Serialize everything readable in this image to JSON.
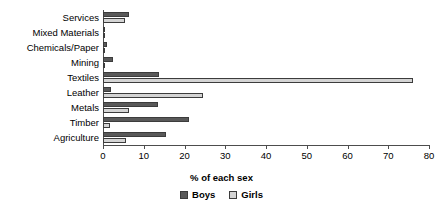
{
  "chart_data": {
    "type": "bar",
    "orientation": "horizontal",
    "title": "",
    "xlabel": "% of each sex",
    "ylabel": "",
    "xlim": [
      0,
      80
    ],
    "xticks": [
      0,
      10,
      20,
      30,
      40,
      50,
      60,
      70,
      80
    ],
    "grid": false,
    "legend_position": "bottom-center",
    "categories": [
      "Services",
      "Mixed Materials",
      "Chemicals/Paper",
      "Mining",
      "Textiles",
      "Leather",
      "Metals",
      "Timber",
      "Agriculture"
    ],
    "series": [
      {
        "name": "Boys",
        "color": "#595959",
        "values": [
          6.5,
          0.6,
          0.9,
          2.5,
          13.8,
          2.0,
          13.5,
          21.0,
          15.5
        ]
      },
      {
        "name": "Girls",
        "color": "#d4d4d4",
        "values": [
          5.5,
          0.3,
          0.4,
          0.3,
          76.0,
          24.5,
          6.4,
          1.7,
          5.6
        ]
      }
    ]
  },
  "axis": {
    "x_title": "% of each sex",
    "tick_labels": [
      "0",
      "10",
      "20",
      "30",
      "40",
      "50",
      "60",
      "70",
      "80"
    ]
  },
  "legend": {
    "items": [
      {
        "label": "Boys"
      },
      {
        "label": "Girls"
      }
    ]
  },
  "colors": {
    "boys": "#595959",
    "girls": "#d4d4d4",
    "axis": "#4d4d4d",
    "background": "#ffffff"
  }
}
